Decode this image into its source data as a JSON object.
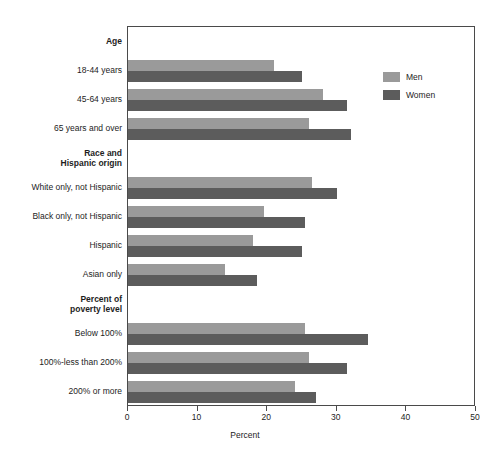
{
  "chart_data": {
    "type": "bar",
    "orientation": "horizontal",
    "title": "",
    "xlabel": "Percent",
    "ylabel": "",
    "xlim": [
      0,
      50
    ],
    "xticks": [
      "0",
      "10",
      "20",
      "30",
      "40",
      "50"
    ],
    "grid": false,
    "legend_position": "top-right",
    "series": [
      {
        "name": "Men",
        "color": "#9a9a9a",
        "values": [
          21.0,
          28.0,
          26.0,
          26.5,
          19.5,
          18.0,
          14.0,
          25.5,
          26.0,
          24.0
        ]
      },
      {
        "name": "Women",
        "color": "#5c5c5c",
        "values": [
          25.0,
          31.5,
          32.0,
          30.0,
          25.5,
          25.0,
          18.5,
          34.5,
          31.5,
          27.0
        ]
      }
    ],
    "categories": [
      "18-44 years",
      "45-64 years",
      "65 years and over",
      "White only, not Hispanic",
      "Black only, not Hispanic",
      "Hispanic",
      "Asian only",
      "Below 100%",
      "100%-less than 200%",
      "200% or more"
    ],
    "group_headings": [
      {
        "label": "Age",
        "before_category": "18-44 years"
      },
      {
        "label": "Race and\nHispanic origin",
        "before_category": "White only, not Hispanic"
      },
      {
        "label": "Percent of\npoverty level",
        "before_category": "Below 100%"
      }
    ]
  },
  "legend": {
    "items": [
      {
        "label": "Men",
        "color": "#9a9a9a"
      },
      {
        "label": "Women",
        "color": "#5c5c5c"
      }
    ]
  },
  "axis": {
    "x_title": "Percent",
    "ticks": [
      "0",
      "10",
      "20",
      "30",
      "40",
      "50"
    ]
  },
  "rows": [
    {
      "kind": "heading",
      "label": "Age"
    },
    {
      "kind": "category",
      "label": "18-44 years",
      "men": 21.0,
      "women": 25.0
    },
    {
      "kind": "category",
      "label": "45-64 years",
      "men": 28.0,
      "women": 31.5
    },
    {
      "kind": "category",
      "label": "65 years and over",
      "men": 26.0,
      "women": 32.0
    },
    {
      "kind": "heading",
      "label": "Race and\nHispanic origin"
    },
    {
      "kind": "category",
      "label": "White only, not Hispanic",
      "men": 26.5,
      "women": 30.0
    },
    {
      "kind": "category",
      "label": "Black only, not Hispanic",
      "men": 19.5,
      "women": 25.5
    },
    {
      "kind": "category",
      "label": "Hispanic",
      "men": 18.0,
      "women": 25.0
    },
    {
      "kind": "category",
      "label": "Asian only",
      "men": 14.0,
      "women": 18.5
    },
    {
      "kind": "heading",
      "label": "Percent of\npoverty level"
    },
    {
      "kind": "category",
      "label": "Below 100%",
      "men": 25.5,
      "women": 34.5
    },
    {
      "kind": "category",
      "label": "100%-less than 200%",
      "men": 26.0,
      "women": 31.5
    },
    {
      "kind": "category",
      "label": "200% or more",
      "men": 24.0,
      "women": 27.0
    }
  ]
}
